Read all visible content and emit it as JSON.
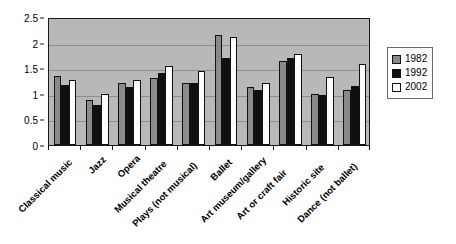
{
  "chart_data": {
    "type": "bar",
    "title": "",
    "subtitle": "",
    "xlabel": "",
    "ylabel": "",
    "ylim": [
      0,
      2.5
    ],
    "ytick_labels": [
      "0",
      "0.5",
      "1",
      "1.5",
      "2",
      "2.5"
    ],
    "ytick_values": [
      0,
      0.5,
      1,
      1.5,
      2,
      2.5
    ],
    "grid": true,
    "legend_position": "right",
    "categories": [
      "Classical music",
      "Jazz",
      "Opera",
      "Musical theatre",
      "Plays (not musical)",
      "Ballet",
      "Art museum/gallery",
      "Art or craft fair",
      "Historic site",
      "Dance (not ballet)"
    ],
    "series": [
      {
        "name": "1982",
        "color": "#8a8a8a",
        "values": [
          1.35,
          0.87,
          1.22,
          1.3,
          1.22,
          2.15,
          1.13,
          1.65,
          1.0,
          1.08
        ]
      },
      {
        "name": "1992",
        "color": "#101010",
        "values": [
          1.17,
          0.78,
          1.13,
          1.4,
          1.21,
          1.7,
          1.08,
          1.7,
          0.98,
          1.15
        ]
      },
      {
        "name": "2002",
        "color": "#fdfdfd",
        "values": [
          1.27,
          1.0,
          1.27,
          1.55,
          1.45,
          2.1,
          1.22,
          1.78,
          1.32,
          1.58
        ]
      }
    ]
  }
}
